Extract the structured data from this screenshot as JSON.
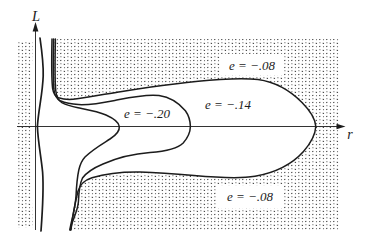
{
  "figure": {
    "axis_labels": {
      "vertical": "L",
      "horizontal": "r"
    },
    "contour_labels": {
      "outer_top": "e = −.08",
      "middle": "e = −.14",
      "inner": "e = −.20",
      "outer_bottom": "e = −.08"
    },
    "contour_levels": [
      -0.08,
      -0.14,
      -0.2
    ],
    "colors": {
      "ink": "#1c1c1c",
      "paper": "#ffffff",
      "stipple_dot": "#353535"
    }
  }
}
